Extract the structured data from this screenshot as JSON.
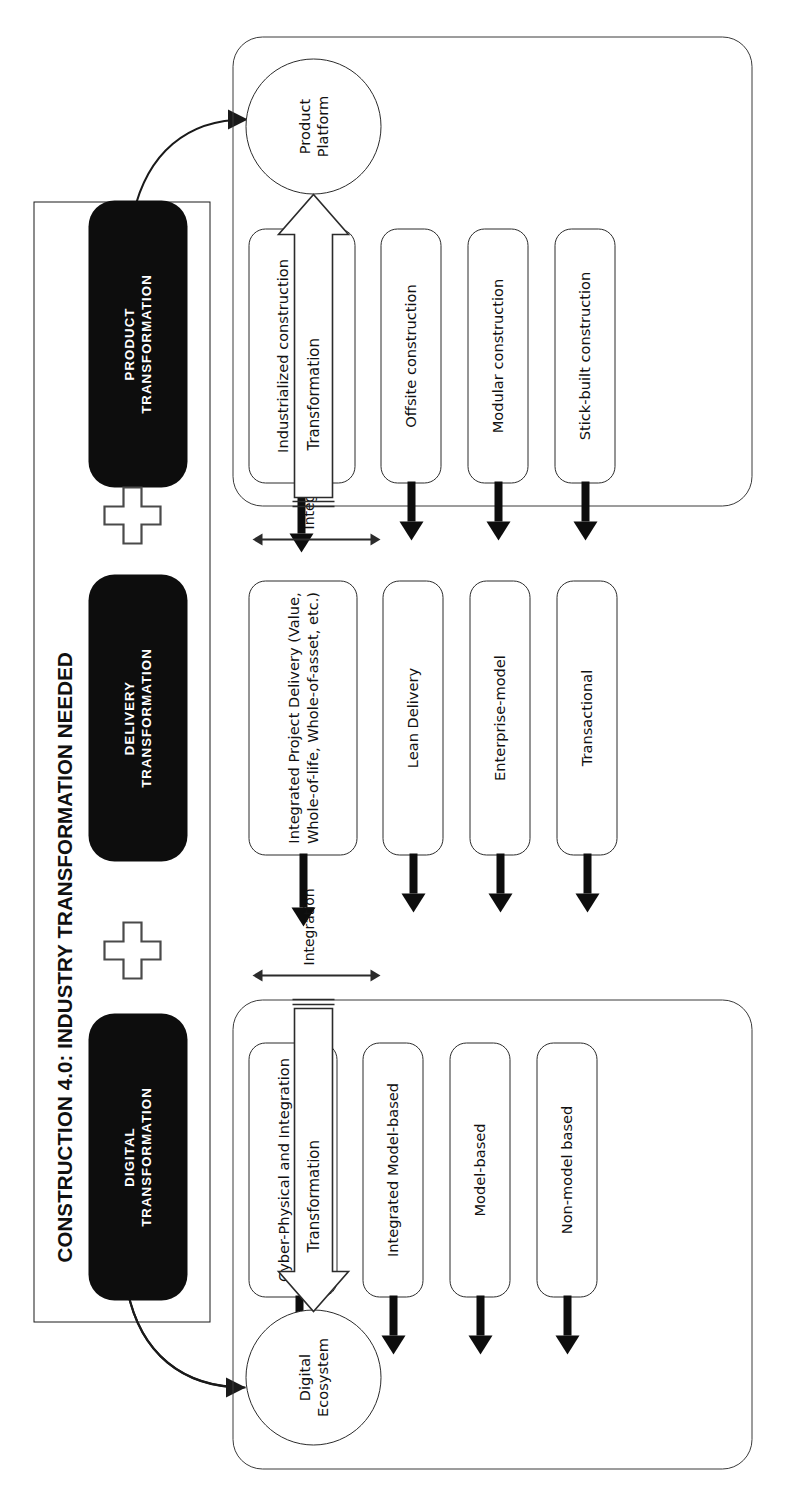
{
  "diagram": {
    "title": "CONSTRUCTION 4.0: INDUSTRY TRANSFORMATION NEEDED",
    "orientation": "rotated-90-ccw",
    "plus_symbols": [
      "+",
      "+"
    ],
    "integration_label_1": "Integration",
    "integration_label_2": "Integration",
    "transformation_label_digital": "Transformation",
    "transformation_label_product": "Transformation"
  },
  "tracks": [
    {
      "id": "product",
      "headline": "PRODUCT TRANSFORMATION",
      "headline_line1": "PRODUCT",
      "headline_line2": "TRANSFORMATION",
      "maturity_stages": [
        "Stick-built construction",
        "Modular construction",
        "Offsite construction",
        "Industrialized construction (Additive Manufacturing, Robotic Assembly, etc.)"
      ],
      "enabler": "Product Platform",
      "enabler_line1": "Product",
      "enabler_line2": "Platform",
      "transformation_arrow_label": "Transformation"
    },
    {
      "id": "delivery",
      "headline": "DELIVERY TRANSFORMATION",
      "headline_line1": "DELIVERY",
      "headline_line2": "TRANSFORMATION",
      "maturity_stages": [
        "Transactional",
        "Enterprise-model",
        "Lean Delivery",
        "Integrated Project Delivery (Value, Whole-of-life, Whole-of-asset, etc.)"
      ],
      "enabler": null,
      "transformation_arrow_label": null
    },
    {
      "id": "digital",
      "headline": "DIGITAL TRANSFORMATION",
      "headline_line1": "DIGITAL",
      "headline_line2": "TRANSFORMATION",
      "maturity_stages": [
        "Non-model based",
        "Model-based",
        "Integrated Model-based",
        "Cyber-Physical and Integration with Digital Technologies"
      ],
      "enabler": "Digital Ecosystem",
      "enabler_line1": "Digital",
      "enabler_line2": "Ecosystem",
      "transformation_arrow_label": "Transformation"
    }
  ],
  "colors": {
    "pill_fill": "#0d0d0d",
    "pill_text": "#ffffff",
    "stroke": "#2b2b2b",
    "arrow": "#0d0d0d",
    "background": "#ffffff"
  }
}
